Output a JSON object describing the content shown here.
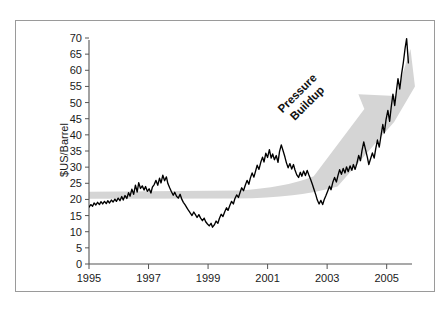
{
  "chart_data": {
    "type": "line",
    "title": "",
    "xlabel": "",
    "ylabel": "$US/Barrel",
    "xlim": [
      1995.0,
      2005.75
    ],
    "ylim": [
      0,
      70
    ],
    "grid": false,
    "legend": null,
    "x_ticks": [
      "1995",
      "1997",
      "1999",
      "2001",
      "2003",
      "2005"
    ],
    "x_tick_values": [
      1995,
      1997,
      1999,
      2001,
      2003,
      2005
    ],
    "y_ticks": [
      "0",
      "5",
      "10",
      "15",
      "20",
      "25",
      "30",
      "35",
      "40",
      "45",
      "50",
      "55",
      "60",
      "65",
      "70"
    ],
    "y_tick_values": [
      0,
      5,
      10,
      15,
      20,
      25,
      30,
      35,
      40,
      45,
      50,
      55,
      60,
      65,
      70
    ],
    "series": [
      {
        "name": "Crude oil price",
        "color": "#000000",
        "x": [
          1995.0,
          1995.06,
          1995.12,
          1995.17,
          1995.23,
          1995.29,
          1995.35,
          1995.4,
          1995.46,
          1995.52,
          1995.58,
          1995.63,
          1995.69,
          1995.75,
          1995.81,
          1995.87,
          1995.92,
          1995.98,
          1996.04,
          1996.1,
          1996.15,
          1996.21,
          1996.27,
          1996.33,
          1996.38,
          1996.44,
          1996.5,
          1996.56,
          1996.62,
          1996.67,
          1996.73,
          1996.79,
          1996.85,
          1996.9,
          1996.96,
          1997.02,
          1997.08,
          1997.13,
          1997.19,
          1997.25,
          1997.31,
          1997.37,
          1997.42,
          1997.48,
          1997.54,
          1997.6,
          1997.65,
          1997.71,
          1997.77,
          1997.83,
          1997.88,
          1997.94,
          1998.0,
          1998.06,
          1998.12,
          1998.17,
          1998.23,
          1998.29,
          1998.35,
          1998.4,
          1998.46,
          1998.52,
          1998.58,
          1998.63,
          1998.69,
          1998.75,
          1998.81,
          1998.87,
          1998.92,
          1998.98,
          1999.04,
          1999.1,
          1999.15,
          1999.21,
          1999.27,
          1999.33,
          1999.38,
          1999.44,
          1999.5,
          1999.56,
          1999.62,
          1999.67,
          1999.73,
          1999.79,
          1999.85,
          1999.9,
          1999.96,
          2000.02,
          2000.08,
          2000.13,
          2000.19,
          2000.25,
          2000.31,
          2000.37,
          2000.42,
          2000.48,
          2000.54,
          2000.6,
          2000.65,
          2000.71,
          2000.77,
          2000.83,
          2000.88,
          2000.94,
          2001.0,
          2001.06,
          2001.12,
          2001.17,
          2001.23,
          2001.29,
          2001.35,
          2001.4,
          2001.46,
          2001.52,
          2001.58,
          2001.63,
          2001.69,
          2001.75,
          2001.81,
          2001.87,
          2001.92,
          2001.98,
          2002.04,
          2002.1,
          2002.15,
          2002.21,
          2002.27,
          2002.33,
          2002.38,
          2002.44,
          2002.5,
          2002.56,
          2002.62,
          2002.67,
          2002.73,
          2002.79,
          2002.85,
          2002.9,
          2002.96,
          2003.02,
          2003.08,
          2003.13,
          2003.19,
          2003.25,
          2003.31,
          2003.37,
          2003.42,
          2003.48,
          2003.54,
          2003.6,
          2003.65,
          2003.71,
          2003.77,
          2003.83,
          2003.88,
          2003.94,
          2004.0,
          2004.06,
          2004.12,
          2004.17,
          2004.23,
          2004.29,
          2004.35,
          2004.4,
          2004.46,
          2004.52,
          2004.58,
          2004.63,
          2004.69,
          2004.75,
          2004.81,
          2004.87,
          2004.92,
          2004.98,
          2005.04,
          2005.1,
          2005.15,
          2005.21,
          2005.27,
          2005.33,
          2005.38,
          2005.44,
          2005.5,
          2005.56,
          2005.62,
          2005.67,
          2005.73
        ],
        "y": [
          17.6,
          18.4,
          17.9,
          18.9,
          18.3,
          19.1,
          18.4,
          19.3,
          18.6,
          19.4,
          18.7,
          19.6,
          18.9,
          19.8,
          19.2,
          20.1,
          19.4,
          20.4,
          19.6,
          20.9,
          19.8,
          21.2,
          20.3,
          22.1,
          21.0,
          23.2,
          21.6,
          24.4,
          22.3,
          25.2,
          23.4,
          24.2,
          22.9,
          24.0,
          22.5,
          23.3,
          22.0,
          23.8,
          24.6,
          25.9,
          24.4,
          26.6,
          25.1,
          27.5,
          25.8,
          27.0,
          24.9,
          23.6,
          22.4,
          21.3,
          22.2,
          21.0,
          20.4,
          21.6,
          20.0,
          19.1,
          18.3,
          17.4,
          16.5,
          15.8,
          15.0,
          16.1,
          15.2,
          14.4,
          15.3,
          14.2,
          13.4,
          14.2,
          13.1,
          12.4,
          11.8,
          12.6,
          11.4,
          12.1,
          13.3,
          12.6,
          14.1,
          15.4,
          14.7,
          16.2,
          17.4,
          16.6,
          18.1,
          19.4,
          18.6,
          20.2,
          21.4,
          20.6,
          22.3,
          23.6,
          22.7,
          24.4,
          25.9,
          24.7,
          26.6,
          28.2,
          26.9,
          28.9,
          30.6,
          29.3,
          31.5,
          33.1,
          31.6,
          34.3,
          33.0,
          35.4,
          32.8,
          34.1,
          32.3,
          33.6,
          31.5,
          34.8,
          36.9,
          35.1,
          33.2,
          31.4,
          29.8,
          31.1,
          29.4,
          30.8,
          29.1,
          27.6,
          26.8,
          28.4,
          27.2,
          28.8,
          27.4,
          29.0,
          27.7,
          26.3,
          24.8,
          23.1,
          21.4,
          19.8,
          18.6,
          19.7,
          18.4,
          19.9,
          21.2,
          22.6,
          24.1,
          23.0,
          25.3,
          26.8,
          25.4,
          27.6,
          29.2,
          27.8,
          29.6,
          28.2,
          30.1,
          28.6,
          30.4,
          29.0,
          30.8,
          29.3,
          31.2,
          33.6,
          32.0,
          35.1,
          37.8,
          35.4,
          33.1,
          30.8,
          32.6,
          34.4,
          32.8,
          35.6,
          38.4,
          36.2,
          39.8,
          43.2,
          40.6,
          44.8,
          47.6,
          44.2,
          48.4,
          52.6,
          49.1,
          53.8,
          57.4,
          54.2,
          58.8,
          62.4,
          66.9,
          69.8,
          62.3
        ]
      }
    ],
    "annotations": [
      {
        "text_lines": [
          "Pressure",
          "Buildup"
        ],
        "rotation_deg": -45,
        "color": "#111111",
        "shape": "arrow-band",
        "shape_color": "#d5d5d5",
        "description": "Wide grey arrow running flat near 21 $US/Barrel from 1995 to 2003 then sweeping sharply upward to about 65 in 2005"
      }
    ]
  },
  "figure": {
    "border_color": "#9a9a9a",
    "background": "#ffffff",
    "line_color": "#000000",
    "band_color": "#d5d5d5",
    "axis_color": "#555555"
  }
}
